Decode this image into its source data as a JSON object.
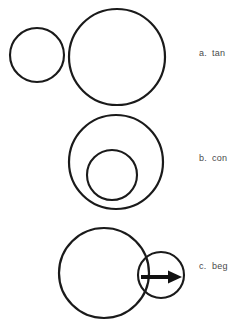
{
  "page": {
    "background_color": "#ffffff",
    "stroke_color": "#1a1a1a",
    "text_color": "#4a4a4a",
    "width": 234,
    "height": 325
  },
  "figures": [
    {
      "id": "figure-a",
      "label_letter": "a.",
      "label_text": "tan",
      "relationship": "externally tangent circles",
      "shapes": [
        {
          "name": "small-circle",
          "cx": 37,
          "cy": 55,
          "r": 27
        },
        {
          "name": "large-circle",
          "cx": 117,
          "cy": 57,
          "r": 48
        }
      ]
    },
    {
      "id": "figure-b",
      "label_letter": "b.",
      "label_text": "con",
      "relationship": "internally tangent circles",
      "shapes": [
        {
          "name": "outer-circle",
          "cx": 116,
          "cy": 162,
          "r": 47
        },
        {
          "name": "inner-circle",
          "cx": 112,
          "cy": 175,
          "r": 25
        }
      ]
    },
    {
      "id": "figure-c",
      "label_letter": "c.",
      "label_text": "beg",
      "relationship": "intersecting circles with direction arrow",
      "shapes": [
        {
          "name": "large-circle",
          "cx": 104,
          "cy": 273,
          "r": 45
        },
        {
          "name": "small-circle",
          "cx": 161,
          "cy": 275,
          "r": 23
        }
      ],
      "arrow": {
        "name": "right-arrow",
        "x_start": 141,
        "x_end": 182,
        "y": 277,
        "shaft_width": 4,
        "head_length": 14,
        "head_width": 13
      }
    }
  ]
}
